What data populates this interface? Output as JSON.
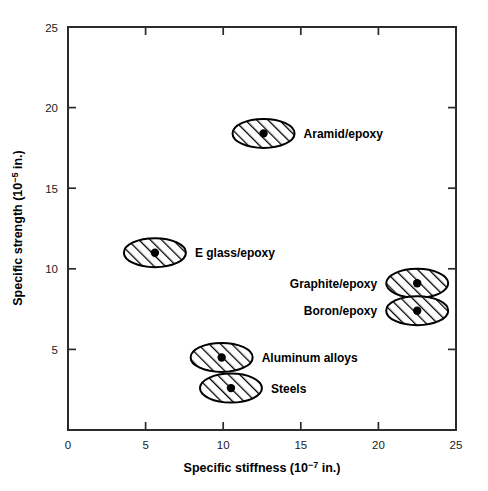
{
  "chart_data": {
    "type": "scatter",
    "title": "",
    "xlabel": "Specific stiffness (10−7 in.)",
    "xlabel_parts": {
      "pre": "Specific stiffness (10",
      "sup": "−7",
      "post": " in.)"
    },
    "ylabel": "Specific strength (10−5 in.)",
    "ylabel_parts": {
      "pre": "Specific strength (10",
      "sup": "−5",
      "post": " in.)"
    },
    "xlim": [
      0,
      25
    ],
    "ylim": [
      0,
      25
    ],
    "xticks": [
      0,
      5,
      10,
      15,
      20,
      25
    ],
    "xtick_labels": [
      "0",
      "5",
      "10",
      "15",
      "20",
      "25"
    ],
    "yticks": [
      5,
      10,
      15,
      20,
      25
    ],
    "ytick_labels": [
      "5",
      "10",
      "15",
      "20",
      "25"
    ],
    "grid": false,
    "legend_position": "none",
    "marker_style": "hatched-ellipse-with-center-dot",
    "points": [
      {
        "label": "Aramid/epoxy",
        "x": 12.6,
        "y": 18.4,
        "label_side": "right"
      },
      {
        "label": "E glass/epoxy",
        "x": 5.6,
        "y": 11.0,
        "label_side": "right"
      },
      {
        "label": "Graphite/epoxy",
        "x": 22.5,
        "y": 9.1,
        "label_side": "left"
      },
      {
        "label": "Boron/epoxy",
        "x": 22.5,
        "y": 7.4,
        "label_side": "left"
      },
      {
        "label": "Aluminum alloys",
        "x": 9.9,
        "y": 4.5,
        "label_side": "right"
      },
      {
        "label": "Steels",
        "x": 10.5,
        "y": 2.6,
        "label_side": "right"
      }
    ]
  },
  "colors": {
    "background": "#ffffff",
    "axis": "#2b2b2b",
    "marker_outline": "#000000",
    "marker_dot": "#000000",
    "text": "#000000"
  }
}
